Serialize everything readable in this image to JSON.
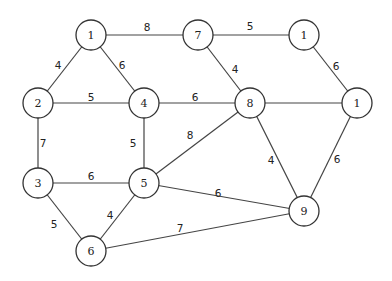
{
  "graph": {
    "nodes": [
      {
        "id": "n1a",
        "label": "1",
        "x": 91,
        "y": 35
      },
      {
        "id": "n7",
        "label": "7",
        "x": 198,
        "y": 35
      },
      {
        "id": "n1b",
        "label": "1",
        "x": 304,
        "y": 35
      },
      {
        "id": "n2",
        "label": "2",
        "x": 38,
        "y": 103
      },
      {
        "id": "n4",
        "label": "4",
        "x": 144,
        "y": 103
      },
      {
        "id": "n8",
        "label": "8",
        "x": 250,
        "y": 103
      },
      {
        "id": "n1c",
        "label": "1",
        "x": 357,
        "y": 103
      },
      {
        "id": "n3",
        "label": "3",
        "x": 38,
        "y": 183
      },
      {
        "id": "n5",
        "label": "5",
        "x": 144,
        "y": 183
      },
      {
        "id": "n9",
        "label": "9",
        "x": 304,
        "y": 211
      },
      {
        "id": "n6",
        "label": "6",
        "x": 91,
        "y": 251
      }
    ],
    "edges": [
      {
        "from": "n1a",
        "to": "n7",
        "weight": "8",
        "lx": 147,
        "ly": 27
      },
      {
        "from": "n7",
        "to": "n1b",
        "weight": "5",
        "lx": 250,
        "ly": 26
      },
      {
        "from": "n1a",
        "to": "n2",
        "weight": "4",
        "lx": 58,
        "ly": 65
      },
      {
        "from": "n1a",
        "to": "n4",
        "weight": "6",
        "lx": 122,
        "ly": 65
      },
      {
        "from": "n7",
        "to": "n8",
        "weight": "4",
        "lx": 235,
        "ly": 69
      },
      {
        "from": "n1b",
        "to": "n1c",
        "weight": "6",
        "lx": 336,
        "ly": 66
      },
      {
        "from": "n2",
        "to": "n4",
        "weight": "5",
        "lx": 91,
        "ly": 97
      },
      {
        "from": "n4",
        "to": "n8",
        "weight": "6",
        "lx": 195,
        "ly": 97
      },
      {
        "from": "n8",
        "to": "n1c",
        "weight": "",
        "lx": 303,
        "ly": 97
      },
      {
        "from": "n2",
        "to": "n3",
        "weight": "7",
        "lx": 43,
        "ly": 143
      },
      {
        "from": "n4",
        "to": "n5",
        "weight": "5",
        "lx": 133,
        "ly": 143
      },
      {
        "from": "n8",
        "to": "n5",
        "weight": "8",
        "lx": 190,
        "ly": 135
      },
      {
        "from": "n8",
        "to": "n9",
        "weight": "4",
        "lx": 271,
        "ly": 160
      },
      {
        "from": "n1c",
        "to": "n9",
        "weight": "6",
        "lx": 337,
        "ly": 159
      },
      {
        "from": "n3",
        "to": "n5",
        "weight": "6",
        "lx": 91,
        "ly": 176
      },
      {
        "from": "n5",
        "to": "n9",
        "weight": "6",
        "lx": 218,
        "ly": 193
      },
      {
        "from": "n3",
        "to": "n6",
        "weight": "5",
        "lx": 54,
        "ly": 224
      },
      {
        "from": "n5",
        "to": "n6",
        "weight": "4",
        "lx": 110,
        "ly": 215
      },
      {
        "from": "n6",
        "to": "n9",
        "weight": "7",
        "lx": 180,
        "ly": 228
      }
    ],
    "node_radius": 15,
    "colors": {
      "stroke": "#333333",
      "fill": "#ffffff",
      "text": "#222222"
    }
  }
}
